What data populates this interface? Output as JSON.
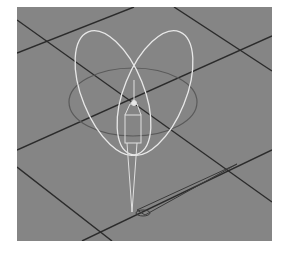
{
  "viewport": {
    "name": "3D perspective viewport",
    "background_color": "#858585",
    "grid_color": "#2b2b2b",
    "rig_color": "#e8e8e8",
    "ground_circle_color": "#5a5a5a"
  },
  "scene": {
    "objects": [
      {
        "type": "rotate-gizmo-ellipses",
        "count": 2
      },
      {
        "type": "horizontal-ring",
        "count": 1
      },
      {
        "type": "bone-chain",
        "count": 1
      },
      {
        "type": "ground-locator-arrow",
        "count": 1
      }
    ]
  }
}
